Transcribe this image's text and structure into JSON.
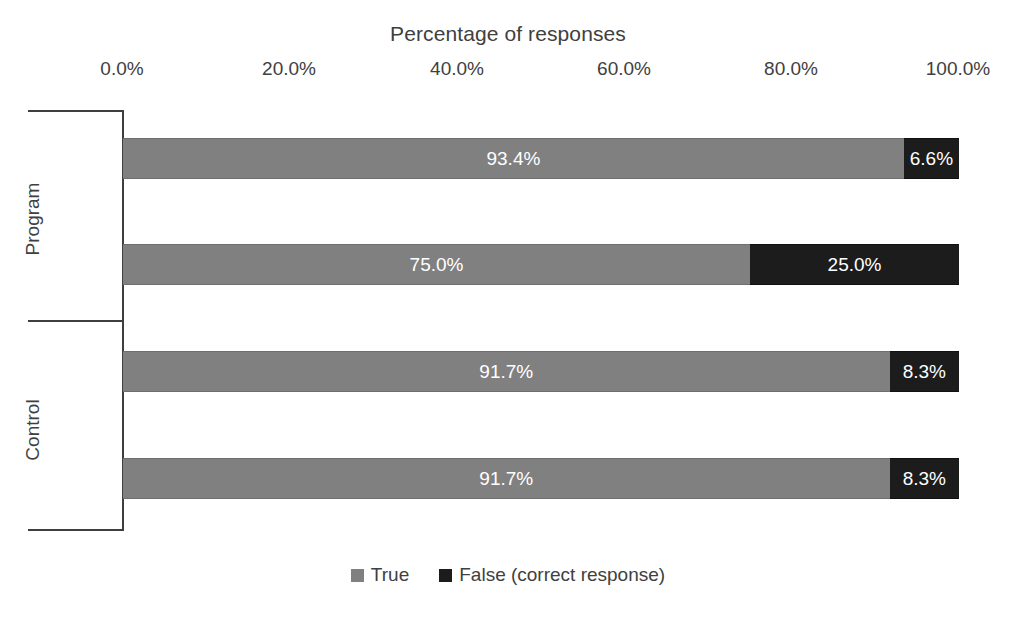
{
  "chart_data": {
    "type": "bar",
    "orientation": "horizontal",
    "stacked": true,
    "stacked_100": true,
    "title": "Percentage of responses",
    "xlabel": "",
    "ylabel": "",
    "xlim": [
      0,
      100
    ],
    "xticks": [
      "0.0%",
      "20.0%",
      "40.0%",
      "60.0%",
      "80.0%",
      "100.0%"
    ],
    "xtick_values": [
      0,
      20,
      40,
      60,
      80,
      100
    ],
    "grid": false,
    "legend_position": "bottom",
    "groups": [
      {
        "name": "Program",
        "categories": [
          "1",
          "2"
        ]
      },
      {
        "name": "Control",
        "categories": [
          "1",
          "2"
        ]
      }
    ],
    "series": [
      {
        "name": "True",
        "color": "#808080",
        "values": [
          93.4,
          75.0,
          91.7,
          91.7
        ],
        "labels": [
          "93.4%",
          "75.0%",
          "91.7%",
          "91.7%"
        ]
      },
      {
        "name": "False (correct response)",
        "color": "#1c1c1c",
        "values": [
          6.6,
          25.0,
          8.3,
          8.3
        ],
        "labels": [
          "6.6%",
          "25.0%",
          "8.3%",
          "8.3%"
        ]
      }
    ],
    "bars": [
      {
        "group": "Program",
        "category": "1",
        "true_value": 93.4,
        "true_label": "93.4%",
        "false_value": 6.6,
        "false_label": "6.6%"
      },
      {
        "group": "Program",
        "category": "2",
        "true_value": 75.0,
        "true_label": "75.0%",
        "false_value": 25.0,
        "false_label": "25.0%"
      },
      {
        "group": "Control",
        "category": "1",
        "true_value": 91.7,
        "true_label": "91.7%",
        "false_value": 8.3,
        "false_label": "8.3%"
      },
      {
        "group": "Control",
        "category": "2",
        "true_value": 91.7,
        "true_label": "91.7%",
        "false_value": 8.3,
        "false_label": "8.3%"
      }
    ],
    "legend": [
      {
        "label": "True",
        "color": "#808080"
      },
      {
        "label": "False (correct response)",
        "color": "#1c1c1c"
      }
    ]
  }
}
